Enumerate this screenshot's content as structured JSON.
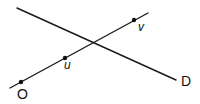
{
  "diagram": {
    "type": "geometry-lines",
    "lines": [
      {
        "id": "line-ouv",
        "x1": 10,
        "y1": 88,
        "x2": 148,
        "y2": 13
      },
      {
        "id": "line-d",
        "x1": 17,
        "y1": 8,
        "x2": 176,
        "y2": 80
      }
    ],
    "points": [
      {
        "id": "point-o",
        "cx": 21,
        "cy": 82,
        "r": 2.2
      },
      {
        "id": "point-u",
        "cx": 65,
        "cy": 58,
        "r": 2.2
      },
      {
        "id": "point-v",
        "cx": 134,
        "cy": 20,
        "r": 2.2
      }
    ],
    "labels": {
      "O": "O",
      "u": "u",
      "v": "v",
      "D": "D"
    }
  }
}
